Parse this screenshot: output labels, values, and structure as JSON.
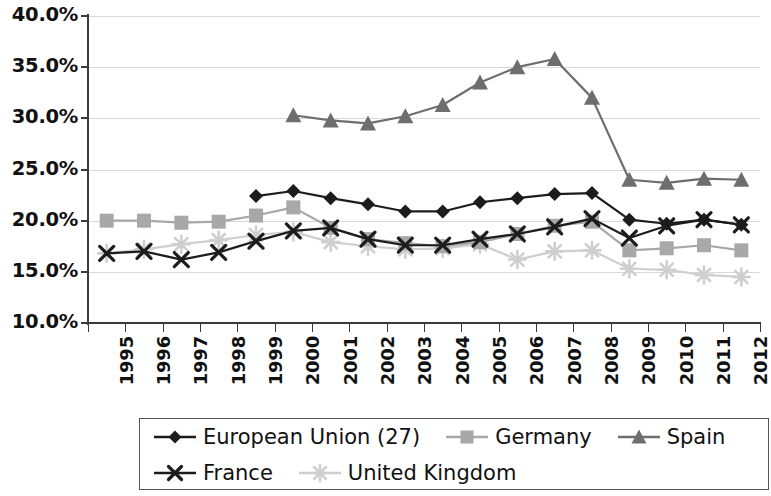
{
  "chart_data": {
    "type": "line",
    "title": "",
    "subtitle": "",
    "xlabel": "",
    "ylabel": "",
    "grid": true,
    "legend_position": "bottom",
    "ylim": [
      10.0,
      40.0
    ],
    "ytick_labels": [
      "40.0%",
      "35.0%",
      "30.0%",
      "25.0%",
      "20.0%",
      "15.0%",
      "10.0%"
    ],
    "ytick_values": [
      40.0,
      35.0,
      30.0,
      25.0,
      20.0,
      15.0,
      10.0
    ],
    "categories": [
      "1995",
      "1996",
      "1997",
      "1998",
      "1999",
      "2000",
      "2001",
      "2002",
      "2003",
      "2004",
      "2005",
      "2006",
      "2007",
      "2008",
      "2009",
      "2010",
      "2011",
      "2012"
    ],
    "x": [
      1995,
      1996,
      1997,
      1998,
      1999,
      2000,
      2001,
      2002,
      2003,
      2004,
      2005,
      2006,
      2007,
      2008,
      2009,
      2010,
      2011,
      2012
    ],
    "series": [
      {
        "name": "European Union (27)",
        "marker": "diamond",
        "color": "#1c1c1c",
        "values": [
          null,
          null,
          null,
          null,
          22.4,
          22.9,
          22.2,
          21.6,
          20.9,
          20.9,
          21.8,
          22.2,
          22.6,
          22.7,
          20.1,
          19.7,
          20.1,
          19.6
        ]
      },
      {
        "name": "Germany",
        "marker": "square",
        "color": "#a8a8a8",
        "values": [
          20.0,
          20.0,
          19.8,
          19.9,
          20.5,
          21.3,
          19.3,
          18.2,
          17.8,
          17.5,
          17.9,
          18.7,
          19.5,
          19.9,
          17.1,
          17.3,
          17.6,
          17.1
        ]
      },
      {
        "name": "Spain",
        "marker": "triangle",
        "color": "#6e6e6e",
        "values": [
          null,
          null,
          null,
          null,
          null,
          30.3,
          29.8,
          29.5,
          30.2,
          31.3,
          33.5,
          35.0,
          35.8,
          32.0,
          24.0,
          23.7,
          24.1,
          24.0
        ]
      },
      {
        "name": "France",
        "marker": "x",
        "color": "#1c1c1c",
        "values": [
          16.8,
          17.0,
          16.2,
          16.9,
          18.0,
          19.0,
          19.3,
          18.2,
          17.6,
          17.6,
          18.2,
          18.7,
          19.4,
          20.2,
          18.3,
          19.5,
          20.1,
          19.6
        ]
      },
      {
        "name": "United Kingdom",
        "marker": "asterisk",
        "color": "#cfcfcf",
        "values": [
          16.8,
          17.2,
          17.7,
          18.1,
          18.6,
          18.9,
          17.9,
          17.5,
          17.2,
          17.3,
          17.7,
          16.2,
          17.0,
          17.1,
          15.3,
          15.2,
          14.7,
          14.5
        ]
      }
    ]
  },
  "legend": {
    "rows": [
      [
        {
          "label": "European Union (27)",
          "marker": "diamond",
          "color": "#1c1c1c"
        },
        {
          "label": "Germany",
          "marker": "square",
          "color": "#a8a8a8"
        },
        {
          "label": "Spain",
          "marker": "triangle",
          "color": "#6e6e6e"
        }
      ],
      [
        {
          "label": "France",
          "marker": "x",
          "color": "#1c1c1c"
        },
        {
          "label": "United Kingdom",
          "marker": "asterisk",
          "color": "#cfcfcf"
        }
      ]
    ]
  }
}
